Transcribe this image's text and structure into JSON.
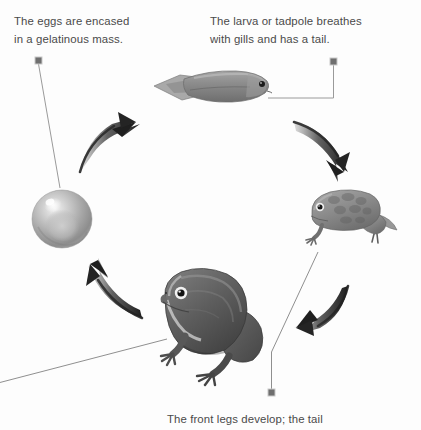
{
  "diagram": {
    "background_color": "#fdfdfd",
    "text_color": "#4a4a4a",
    "line_color": "#8a8a8a",
    "arrow_color": "#2b2b2b",
    "width": 421,
    "height": 430
  },
  "captions": {
    "eggs": "The eggs are encased\nin a gelatinous mass.",
    "larva": "The larva or tadpole breathes\nwith gills and has a tail.",
    "front_legs": "The front legs develop; the tail"
  },
  "stages": [
    {
      "id": "egg",
      "label": "egg",
      "caption_ref": "eggs",
      "position": {
        "x": 30,
        "y": 186
      },
      "size": {
        "w": 62,
        "h": 60
      },
      "color": "#a9a9a9"
    },
    {
      "id": "tadpole",
      "label": "tadpole",
      "caption_ref": "larva",
      "position": {
        "x": 155,
        "y": 70
      },
      "size": {
        "w": 120,
        "h": 40
      },
      "color": "#8f8f8f"
    },
    {
      "id": "froglet",
      "label": "froglet",
      "caption_ref": "front_legs",
      "position": {
        "x": 303,
        "y": 186
      },
      "size": {
        "w": 96,
        "h": 62
      },
      "color": "#8b8b8b"
    },
    {
      "id": "adult-frog",
      "label": "adult frog",
      "caption_ref": null,
      "position": {
        "x": 160,
        "y": 268
      },
      "size": {
        "w": 112,
        "h": 112
      },
      "color": "#5a5a5a"
    }
  ],
  "arrows": [
    {
      "id": "arrow-egg-to-tadpole",
      "direction": "up-right",
      "position": {
        "x": 78,
        "y": 115
      }
    },
    {
      "id": "arrow-tadpole-to-froglet",
      "direction": "down-right",
      "position": {
        "x": 297,
        "y": 118
      }
    },
    {
      "id": "arrow-froglet-to-frog",
      "direction": "down-left",
      "position": {
        "x": 290,
        "y": 285
      }
    },
    {
      "id": "arrow-frog-to-egg",
      "direction": "up-left",
      "position": {
        "x": 78,
        "y": 262
      }
    }
  ],
  "leader_lines": [
    {
      "id": "leader-eggs",
      "marker": {
        "x": 38,
        "y": 60
      },
      "target": {
        "x": 62,
        "y": 190
      }
    },
    {
      "id": "leader-larva",
      "marker": {
        "x": 333,
        "y": 61
      },
      "target": {
        "x": 268,
        "y": 98
      }
    },
    {
      "id": "leader-front-legs",
      "marker": {
        "x": 271,
        "y": 393
      },
      "target": {
        "x": 318,
        "y": 252
      }
    },
    {
      "id": "leader-adult",
      "marker": null,
      "target": {
        "x": 166,
        "y": 340
      }
    }
  ]
}
